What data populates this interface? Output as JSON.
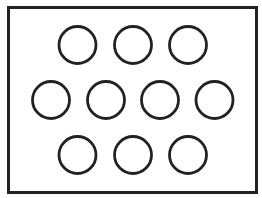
{
  "diagram": {
    "background": "#ffffff",
    "stroke_color": "#222222",
    "frame": {
      "x": 8.5,
      "y": 7.5,
      "width": 248,
      "height": 185,
      "stroke_width": 3
    },
    "circle_radius": 18.5,
    "circle_stroke_width": 2.8,
    "rows": [
      {
        "name": "top-row",
        "cy": 45,
        "cx": [
          77.5,
          133,
          188
        ]
      },
      {
        "name": "middle-row",
        "cy": 100,
        "cx": [
          51,
          106,
          160,
          214.5
        ]
      },
      {
        "name": "bottom-row",
        "cy": 155,
        "cx": [
          77.5,
          133,
          188
        ]
      }
    ],
    "circle_count": 10
  }
}
